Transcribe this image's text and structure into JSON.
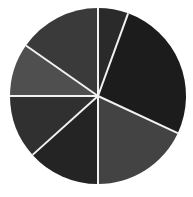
{
  "chart_data": {
    "type": "pie",
    "title": "",
    "subtitle": "",
    "xlabel": "",
    "ylabel": "",
    "legend": null,
    "legend_position": "none",
    "grid": false,
    "labels": [
      "Slice 1",
      "Slice 2",
      "Slice 3",
      "Slice 4",
      "Slice 5",
      "Slice 6",
      "Slice 7"
    ],
    "values": [
      20,
      26,
      18,
      13,
      12,
      6,
      5
    ],
    "start_angle_deg": 0,
    "direction": "clockwise",
    "slice_boundaries_deg": [
      0,
      20,
      115,
      180,
      228,
      270,
      305,
      360
    ],
    "slice_angles_deg": [
      20,
      95,
      65,
      48,
      42,
      35,
      55
    ],
    "colors": [
      "#2a2a2a",
      "#1c1c1c",
      "#434343",
      "#242424",
      "#303030",
      "#4f4f4f",
      "#3a3a3a"
    ],
    "separator_color": "#f2f2f2",
    "separator_width_px": 2,
    "background_color": "#ffffff",
    "center": {
      "x": 98,
      "y": 96
    },
    "radius": 88,
    "data_labels_shown": false,
    "axis_shown": false
  },
  "figure": {
    "width": 193,
    "height": 197,
    "background": "#ffffff"
  }
}
